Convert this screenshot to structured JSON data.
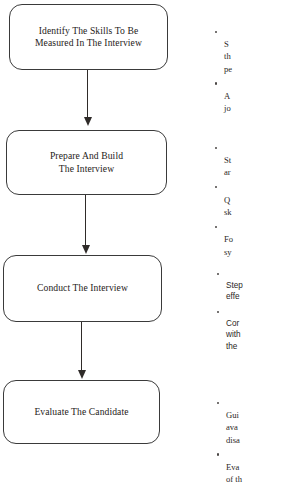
{
  "diagram": {
    "type": "flowchart",
    "orientation": "vertical",
    "title": "",
    "colors": {
      "background": "#ffffff",
      "node_border": "#3a3a3a",
      "node_fill": "#ffffff",
      "text": "#262220",
      "arrow": "#2f2b29",
      "bullet": "#4a4644"
    },
    "nodes": [
      {
        "id": "node-1",
        "label": "Identify The Skills To Be\nMeasured In The Interview",
        "shape": "rounded-rectangle"
      },
      {
        "id": "node-2",
        "label": "Prepare And Build\nThe Interview",
        "shape": "rounded-rectangle"
      },
      {
        "id": "node-3",
        "label": "Conduct The Interview",
        "shape": "rounded-rectangle"
      },
      {
        "id": "node-4",
        "label": "Evaluate The Candidate",
        "shape": "rounded-rectangle"
      }
    ],
    "connectors": [
      {
        "id": "conn-1",
        "from": "node-1",
        "to": "node-2",
        "style": "arrow-down"
      },
      {
        "id": "conn-2",
        "from": "node-2",
        "to": "node-3",
        "style": "arrow-down"
      },
      {
        "id": "conn-3",
        "from": "node-3",
        "to": "node-4",
        "style": "arrow-down"
      }
    ],
    "annotations": [
      {
        "id": "notes-1",
        "for": "node-1",
        "clipped": true,
        "items": [
          "S\nth\npe",
          "A\njo"
        ]
      },
      {
        "id": "notes-2",
        "for": "node-2",
        "clipped": true,
        "items": [
          "St\nar",
          "Q\nsk",
          "Fo\nsy"
        ]
      },
      {
        "id": "notes-3",
        "for": "node-3",
        "clipped": true,
        "items": [
          "Step\neffe",
          "Cor\nwith\nthe"
        ]
      },
      {
        "id": "notes-4",
        "for": "node-4",
        "clipped": true,
        "items": [
          "Gui\nava\ndisa",
          "Eva\nof th"
        ]
      }
    ]
  }
}
